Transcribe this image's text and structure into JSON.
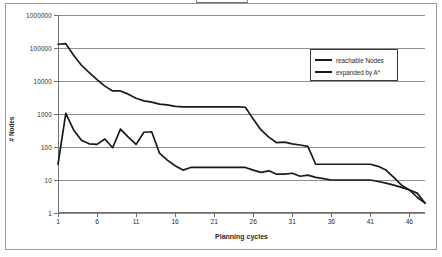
{
  "chart_data": {
    "type": "line",
    "title": "",
    "xlabel": "Planning cycles",
    "ylabel": "# Nodes",
    "yscale": "log",
    "ylim": [
      1,
      1000000
    ],
    "xlim": [
      1,
      48
    ],
    "grid": true,
    "legend_position": "top-right",
    "y_ticks": [
      "1",
      "10",
      "100",
      "1000",
      "10000",
      "100000",
      "1000000"
    ],
    "y_tick_values": [
      1,
      10,
      100,
      1000,
      10000,
      100000,
      1000000
    ],
    "x_ticks": [
      "1",
      "6",
      "11",
      "16",
      "21",
      "26",
      "31",
      "36",
      "41",
      "46"
    ],
    "x_tick_values": [
      1,
      6,
      11,
      16,
      21,
      26,
      31,
      36,
      41,
      46
    ],
    "x": [
      1,
      2,
      3,
      4,
      5,
      6,
      7,
      8,
      9,
      10,
      11,
      12,
      13,
      14,
      15,
      16,
      17,
      18,
      19,
      20,
      21,
      22,
      23,
      24,
      25,
      26,
      27,
      28,
      29,
      30,
      31,
      32,
      33,
      34,
      35,
      36,
      37,
      38,
      39,
      40,
      41,
      42,
      43,
      44,
      45,
      46,
      47,
      48
    ],
    "series": [
      {
        "name": "reachable Nodes",
        "color": "#1a1a1a",
        "values": [
          130000,
          135000,
          60000,
          30000,
          18000,
          11000,
          7000,
          5000,
          5000,
          4000,
          3000,
          2500,
          2300,
          2000,
          1900,
          1700,
          1650,
          1650,
          1650,
          1650,
          1650,
          1650,
          1650,
          1650,
          1600,
          700,
          330,
          200,
          135,
          140,
          125,
          115,
          105,
          30,
          30,
          30,
          30,
          30,
          30,
          30,
          30,
          26,
          20,
          12,
          7,
          5,
          3,
          2
        ]
      },
      {
        "name": "expanded by A*",
        "color": "#1a1a1a",
        "values": [
          30,
          1050,
          330,
          160,
          125,
          120,
          175,
          95,
          350,
          200,
          120,
          280,
          290,
          65,
          40,
          27,
          20,
          24,
          24,
          24,
          24,
          24,
          24,
          24,
          24,
          20,
          17,
          19,
          15,
          15,
          16,
          13,
          14,
          12,
          11,
          10,
          10,
          10,
          10,
          10,
          10,
          9,
          8,
          7,
          6,
          5,
          4,
          2
        ]
      }
    ]
  },
  "legend": {
    "items": [
      {
        "label": "reachable Nodes"
      },
      {
        "label": "expanded by A*"
      }
    ]
  },
  "axes": {
    "y_title": "# Nodes",
    "x_title": "Planning cycles"
  }
}
